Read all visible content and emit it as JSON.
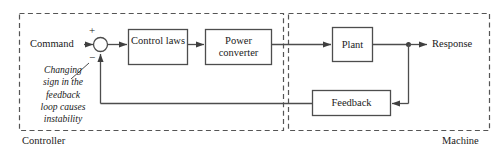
{
  "diagram": {
    "zones": [
      {
        "id": "controller",
        "label": "Controller"
      },
      {
        "id": "machine",
        "label": "Machine"
      }
    ],
    "blocks": [
      {
        "id": "control-laws",
        "label": "Control laws"
      },
      {
        "id": "power-converter",
        "label": "Power converter"
      },
      {
        "id": "plant",
        "label": "Plant"
      },
      {
        "id": "feedback",
        "label": "Feedback"
      }
    ],
    "io": {
      "input_label": "Command",
      "output_label": "Response"
    },
    "summing_junction": {
      "name": "summing-junction",
      "plus_sign": "+",
      "minus_sign": "−"
    },
    "annotation": {
      "lines": [
        "Changing",
        "sign in the",
        "feedback",
        "loop causes",
        "instability"
      ]
    },
    "colors": {
      "line": "#4d4d4d",
      "text": "#1a1a1a",
      "dashed_border": "#555555",
      "background": "#ffffff"
    }
  }
}
